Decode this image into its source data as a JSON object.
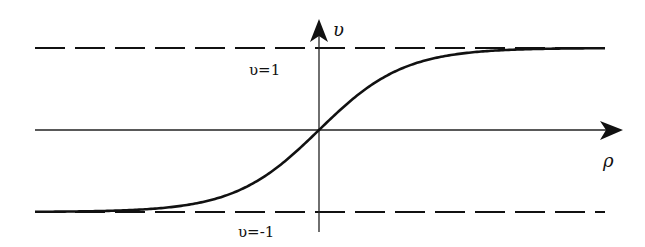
{
  "diagram": {
    "type": "function-plot",
    "axes": {
      "x_label": "ρ",
      "y_label": "υ"
    },
    "asymptotes": [
      {
        "label": "υ=1",
        "value": 1,
        "style": "dashed"
      },
      {
        "label": "υ=-1",
        "value": -1,
        "style": "dashed"
      }
    ],
    "curve": {
      "form": "tanh",
      "passes_through_origin": true
    },
    "colors": {
      "line": "#111111",
      "background": "#ffffff"
    }
  }
}
